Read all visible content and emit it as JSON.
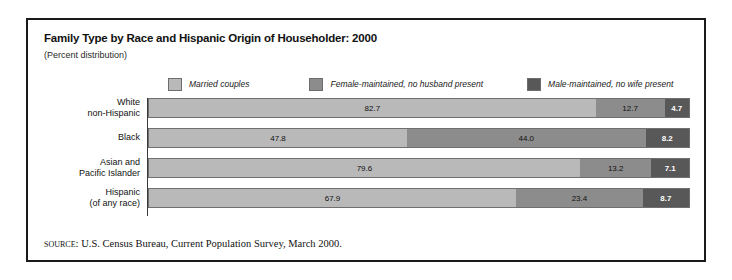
{
  "title": "Family Type by Race and Hispanic Origin of Householder: 2000",
  "subtitle": "(Percent distribution)",
  "source": {
    "label": "Source:",
    "text": "U.S. Census Bureau, Current Population Survey, March 2000."
  },
  "colors": {
    "married": "#b9b9b9",
    "female_maintained": "#8c8c8c",
    "male_maintained": "#585858",
    "border": "#6f6f6f",
    "frame": "#1a1a1a"
  },
  "legend": {
    "items": [
      {
        "label": "Married couples",
        "color": "#b9b9b9"
      },
      {
        "label": "Female-maintained, no husband present",
        "color": "#8c8c8c"
      },
      {
        "label": "Male-maintained, no wife present",
        "color": "#585858"
      }
    ]
  },
  "rows": [
    {
      "label_line1": "White",
      "label_line2": "non-Hispanic",
      "values": [
        "82.7",
        "12.7",
        "4.7"
      ]
    },
    {
      "label_line1": "Black",
      "label_line2": "",
      "values": [
        "47.8",
        "44.0",
        "8.2"
      ]
    },
    {
      "label_line1": "Asian and",
      "label_line2": "Pacific Islander",
      "values": [
        "79.6",
        "13.2",
        "7.1"
      ]
    },
    {
      "label_line1": "Hispanic",
      "label_line2": "(of any race)",
      "values": [
        "67.9",
        "23.4",
        "8.7"
      ]
    }
  ],
  "chart_data": {
    "type": "bar",
    "orientation": "horizontal",
    "stacked": true,
    "normalized": true,
    "title": "Family Type by Race and Hispanic Origin of Householder: 2000",
    "subtitle": "(Percent distribution)",
    "xlabel": "",
    "ylabel": "",
    "xlim": [
      0,
      100
    ],
    "grid": false,
    "legend_position": "top",
    "categories": [
      "White non-Hispanic",
      "Black",
      "Asian and Pacific Islander",
      "Hispanic (of any race)"
    ],
    "series": [
      {
        "name": "Married couples",
        "color": "#b9b9b9",
        "values": [
          82.7,
          47.8,
          79.6,
          67.9
        ]
      },
      {
        "name": "Female-maintained, no husband present",
        "color": "#8c8c8c",
        "values": [
          12.7,
          44.0,
          13.2,
          23.4
        ]
      },
      {
        "name": "Male-maintained, no wife present",
        "color": "#585858",
        "values": [
          4.7,
          8.2,
          7.1,
          8.7
        ]
      }
    ],
    "source": "Source: U.S. Census Bureau, Current Population Survey, March 2000."
  }
}
